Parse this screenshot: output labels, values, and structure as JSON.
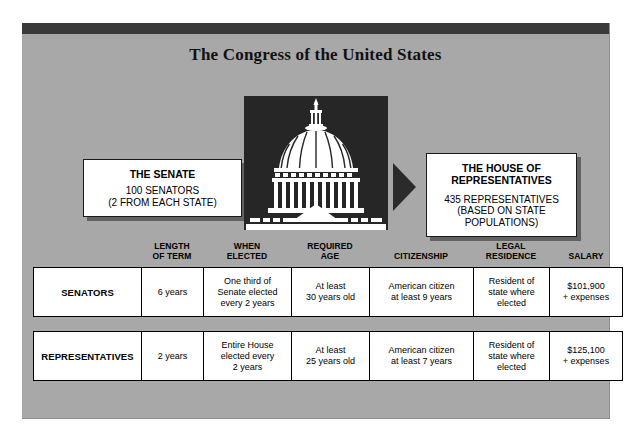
{
  "poster": {
    "title": "The Congress of the United States",
    "capitol_image_name": "capitol-dome-illustration"
  },
  "senate_box": {
    "heading": "THE SENATE",
    "line1": "100 SENATORS",
    "line2": "(2 FROM EACH STATE)"
  },
  "house_box": {
    "heading_line1": "THE HOUSE OF",
    "heading_line2": "REPRESENTATIVES",
    "line1": "435 REPRESENTATIVES",
    "line2": "(BASED ON STATE",
    "line3": "POPULATIONS)"
  },
  "table": {
    "headers": [
      {
        "line1": "",
        "line2": ""
      },
      {
        "line1": "LENGTH",
        "line2": "OF TERM"
      },
      {
        "line1": "WHEN",
        "line2": "ELECTED"
      },
      {
        "line1": "REQUIRED",
        "line2": "AGE"
      },
      {
        "line1": "CITIZENSHIP",
        "line2": ""
      },
      {
        "line1": "LEGAL",
        "line2": "RESIDENCE"
      },
      {
        "line1": "SALARY",
        "line2": ""
      }
    ],
    "rows": [
      {
        "label": "SENATORS",
        "length_of_term": {
          "l1": "6 years",
          "l2": "",
          "l3": ""
        },
        "when_elected": {
          "l1": "One third of",
          "l2": "Senate elected",
          "l3": "every 2 years"
        },
        "required_age": {
          "l1": "At least",
          "l2": "30 years old",
          "l3": ""
        },
        "citizenship": {
          "l1": "American citizen",
          "l2": "at least 9 years",
          "l3": ""
        },
        "legal_residence": {
          "l1": "Resident of",
          "l2": "state where",
          "l3": "elected"
        },
        "salary": {
          "l1": "$101,900",
          "l2": "+ expenses",
          "l3": ""
        }
      },
      {
        "label": "REPRESENTATIVES",
        "length_of_term": {
          "l1": "2 years",
          "l2": "",
          "l3": ""
        },
        "when_elected": {
          "l1": "Entire House",
          "l2": "elected every",
          "l3": "2 years"
        },
        "required_age": {
          "l1": "At least",
          "l2": "25 years old",
          "l3": ""
        },
        "citizenship": {
          "l1": "American citizen",
          "l2": "at least 7 years",
          "l3": ""
        },
        "legal_residence": {
          "l1": "Resident of",
          "l2": "state where",
          "l3": "elected"
        },
        "salary": {
          "l1": "$125,100",
          "l2": "+ expenses",
          "l3": ""
        }
      }
    ]
  },
  "colors": {
    "panel_background": "#a8a8a8",
    "top_bar": "#3a3a3a",
    "image_background": "#262626",
    "arrow": "#2b2b2b",
    "box_background": "#ffffff",
    "text": "#000000"
  }
}
